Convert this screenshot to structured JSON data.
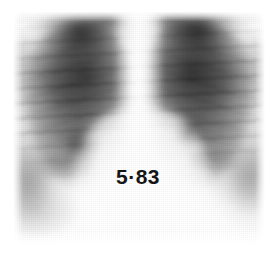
{
  "figure": {
    "kind": "chest-radiograph",
    "modality": "X-ray",
    "view": "postero-anterior chest",
    "annotation": "5·83",
    "background_color": "#ffffff",
    "film_tone_color": "#c4c4c4",
    "annotation_color": "#151515"
  },
  "regions": {
    "right_lung_field": "right lung field",
    "left_lung_field": "left lung field",
    "mediastinum": "mediastinum",
    "cardiac_silhouette": "cardiac silhouette",
    "diaphragm": "diaphragm",
    "right_hilum": "right hilum",
    "left_hilum": "left hilum",
    "rib_shadows": "rib shadows",
    "lung_apices": "lung apices"
  }
}
